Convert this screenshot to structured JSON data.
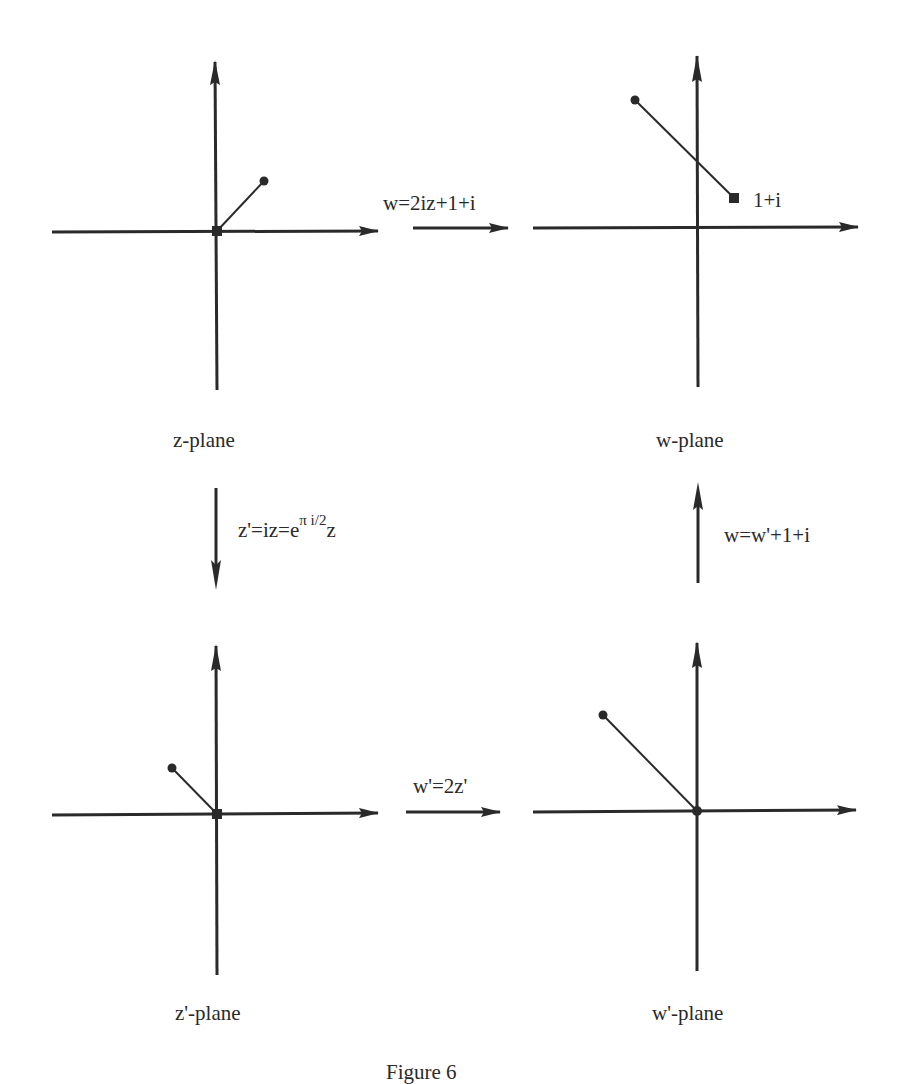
{
  "planes": {
    "z": {
      "label": "z-plane"
    },
    "w": {
      "label": "w-plane",
      "point_label": "1+i"
    },
    "zp": {
      "label": "z'-plane"
    },
    "wp": {
      "label": "w'-plane"
    }
  },
  "maps": {
    "z_to_w": {
      "label": "w=2iz+1+i"
    },
    "z_to_zp": {
      "label_base": "z'=iz=e",
      "label_sup": "π i/2",
      "label_tail": "z"
    },
    "zp_to_wp": {
      "label": "w'=2z'"
    },
    "wp_to_w": {
      "label": "w=w'+1+i"
    }
  },
  "caption": {
    "text": "Figure 6"
  },
  "colors": {
    "ink": "#2a2a2a",
    "background": "#ffffff"
  }
}
